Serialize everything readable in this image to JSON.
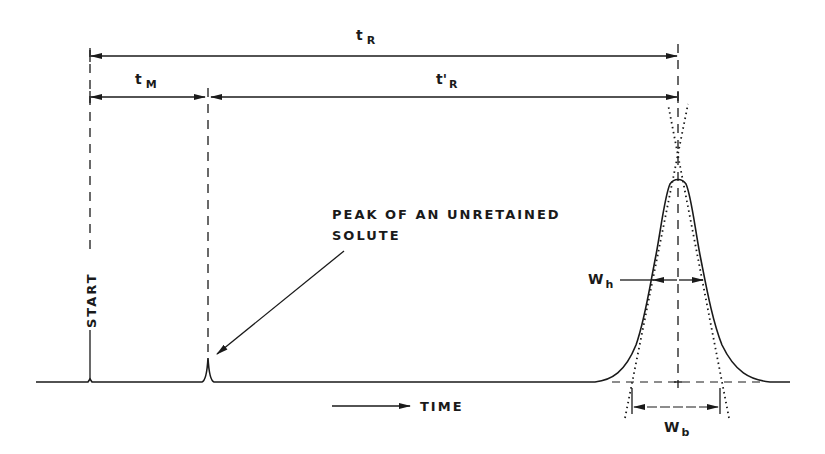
{
  "diagram": {
    "labels": {
      "t_R": {
        "main": "t",
        "sub": "R"
      },
      "t_M": {
        "main": "t",
        "sub": "M"
      },
      "t_prime_R": {
        "main": "t'",
        "sub": "R"
      },
      "w_h": {
        "main": "W",
        "sub": "h"
      },
      "w_b": {
        "main": "W",
        "sub": "b"
      },
      "start": "START",
      "time": "TIME",
      "unretained_line1": "PEAK OF AN UNRETAINED",
      "unretained_line2": "SOLUTE"
    },
    "colors": {
      "ink": "#1a1a1a",
      "background": "#ffffff"
    }
  }
}
